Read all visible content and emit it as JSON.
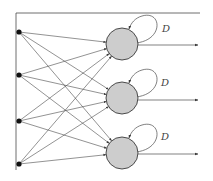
{
  "diagram": {
    "type": "recurrent-neural-network",
    "colors": {
      "line": "#4a4a4a",
      "node_fill": "#cdcdcd",
      "node_stroke": "#3a3a3a",
      "input_dot": "#111111",
      "background": "#ffffff"
    },
    "frame": {
      "vertical_line": {
        "x": 16,
        "y1": 13,
        "y2": 170
      },
      "top_line": {
        "x1": 16,
        "x2": 200,
        "y": 13
      }
    },
    "inputs": [
      {
        "id": "x1",
        "x": 19,
        "y": 32
      },
      {
        "id": "x2",
        "x": 19,
        "y": 75
      },
      {
        "id": "x3",
        "x": 19,
        "y": 121
      },
      {
        "id": "x4",
        "x": 19,
        "y": 164
      }
    ],
    "neurons": [
      {
        "id": "n1",
        "cx": 122,
        "cy": 44,
        "r": 16,
        "delay_label": "D",
        "label_x": 162,
        "label_y": 32,
        "output_y": 45
      },
      {
        "id": "n2",
        "cx": 122,
        "cy": 98,
        "r": 16,
        "delay_label": "D",
        "label_x": 161,
        "label_y": 86,
        "output_y": 100
      },
      {
        "id": "n3",
        "cx": 122,
        "cy": 153,
        "r": 16,
        "delay_label": "D",
        "label_x": 161,
        "label_y": 140,
        "output_y": 154
      }
    ],
    "output_end_x": 198
  }
}
